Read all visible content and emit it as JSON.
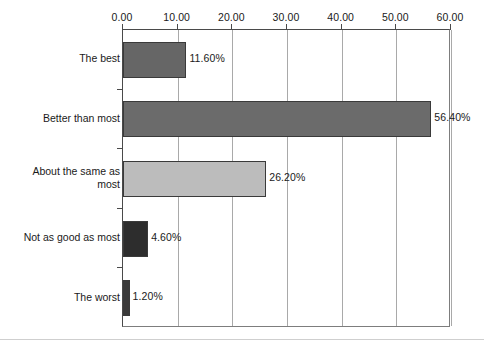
{
  "chart_data": {
    "type": "bar",
    "orientation": "horizontal",
    "title": "",
    "xlabel": "",
    "ylabel": "",
    "xlim": [
      0,
      60
    ],
    "xticks": [
      "0.00",
      "10.00",
      "20.00",
      "30.00",
      "40.00",
      "50.00",
      "60.00"
    ],
    "xtick_values": [
      0,
      10,
      20,
      30,
      40,
      50,
      60
    ],
    "grid": "vertical",
    "axis_position": "top",
    "legend": "none",
    "categories": [
      "The best",
      "Better than most",
      "About the same as\nmost",
      "Not as good as most",
      "The worst"
    ],
    "values": [
      11.6,
      56.4,
      26.2,
      4.6,
      1.2
    ],
    "data_labels": [
      "11.60%",
      "56.40%",
      "26.20%",
      "4.60%",
      "1.20%"
    ],
    "bar_colors": [
      "#666666",
      "#6b6b6b",
      "#bcbcbc",
      "#2d2d2d",
      "#3a3a3a"
    ],
    "bar_edge_color": "#3a3a3a"
  },
  "axis": {
    "frame_color": "#4a4a4a",
    "gridline_color": "#a9a9a9",
    "tick_color": "#4a4a4a"
  },
  "artifact": {
    "clipped_title": ""
  }
}
